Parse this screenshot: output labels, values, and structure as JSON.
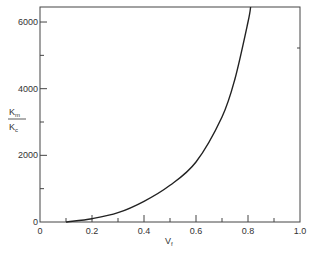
{
  "chart_data": {
    "type": "line",
    "title": "",
    "xlabel": "V_f",
    "ylabel": "K_m / K_c",
    "ylabel_parts": {
      "numerator": "K",
      "numerator_sub": "m",
      "denominator": "K",
      "denominator_sub": "c"
    },
    "xlabel_parts": {
      "main": "V",
      "sub": "f"
    },
    "xlim": [
      0,
      1.0
    ],
    "ylim": [
      0,
      6450
    ],
    "x_ticks": [
      "0",
      "0.2",
      "0.4",
      "0.6",
      "0.8",
      "1.0"
    ],
    "x_tick_values": [
      0,
      0.2,
      0.4,
      0.6,
      0.8,
      1.0
    ],
    "x_minor_ticks": [
      0.1,
      0.3,
      0.5,
      0.7,
      0.9
    ],
    "y_ticks": [
      "0",
      "2000",
      "4000",
      "6000"
    ],
    "y_tick_values": [
      0,
      2000,
      4000,
      6000
    ],
    "y_minor_ticks": [
      1000,
      3000,
      5000
    ],
    "grid": false,
    "legend": null,
    "series": [
      {
        "name": "K_m/K_c vs V_f",
        "x": [
          0.1,
          0.2,
          0.3,
          0.4,
          0.5,
          0.6,
          0.7,
          0.75,
          0.8,
          0.81
        ],
        "values": [
          0,
          100,
          280,
          620,
          1100,
          1800,
          3150,
          4300,
          6000,
          6450
        ]
      }
    ]
  }
}
